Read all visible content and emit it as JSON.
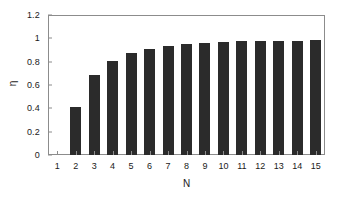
{
  "chart_data": {
    "type": "bar",
    "title": "",
    "xlabel": "N",
    "ylabel": "η",
    "categories": [
      "1",
      "2",
      "3",
      "4",
      "5",
      "6",
      "7",
      "8",
      "9",
      "10",
      "11",
      "12",
      "13",
      "14",
      "15"
    ],
    "values": [
      0,
      0.41,
      0.685,
      0.81,
      0.875,
      0.912,
      0.937,
      0.953,
      0.959,
      0.968,
      0.975,
      0.977,
      0.979,
      0.981,
      0.987
    ],
    "ylim": [
      0,
      1.2
    ],
    "ytick_labels": [
      "0",
      "0.2",
      "0.4",
      "0.6",
      "0.8",
      "1",
      "1.2"
    ],
    "ytick_values": [
      0,
      0.2,
      0.4,
      0.6,
      0.8,
      1,
      1.2
    ],
    "xtick_labels": [
      "1",
      "2",
      "3",
      "4",
      "5",
      "6",
      "7",
      "8",
      "9",
      "10",
      "11",
      "12",
      "13",
      "14",
      "15"
    ],
    "grid": false,
    "legend": null,
    "bar_color": "#2b2b2b",
    "axis_color": "#8c8c8c",
    "background_color": "#ffffff"
  }
}
